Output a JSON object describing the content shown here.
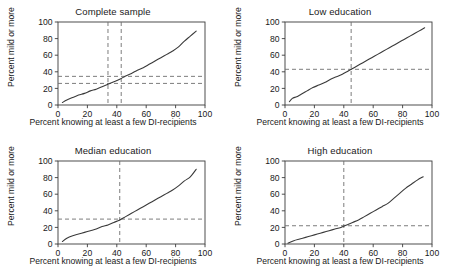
{
  "figure": {
    "width": 453,
    "height": 278,
    "background": "#ffffff",
    "line_color": "#3a3a3a",
    "refline_color": "#6e6e6e",
    "axis_color": "#3b3b3b"
  },
  "common": {
    "xlabel": "Percent knowing at least a few DI-recipients",
    "ylabel": "Percent mild or more",
    "xticks": [
      0,
      20,
      40,
      60,
      80,
      100
    ],
    "yticks": [
      0,
      20,
      40,
      60,
      80,
      100
    ],
    "xlim": [
      0,
      100
    ],
    "ylim": [
      0,
      100
    ]
  },
  "chart_data": [
    {
      "type": "line",
      "panel": 1,
      "title": "Complete sample",
      "xlabel": "Percent knowing at least a few DI-recipients",
      "ylabel": "Percent mild or more",
      "xlim": [
        0,
        100
      ],
      "ylim": [
        0,
        100
      ],
      "xticks": [
        0,
        20,
        40,
        60,
        80,
        100
      ],
      "yticks": [
        0,
        20,
        40,
        60,
        80,
        100
      ],
      "grid": false,
      "legend": "none",
      "x": [
        3,
        6,
        10,
        14,
        18,
        22,
        26,
        30,
        34,
        38,
        42,
        46,
        50,
        54,
        58,
        62,
        66,
        70,
        74,
        78,
        82,
        86,
        90,
        94
      ],
      "y": [
        3,
        6,
        9,
        12,
        14,
        17,
        19,
        22,
        25,
        28,
        31,
        35,
        38,
        42,
        45,
        49,
        53,
        57,
        61,
        65,
        70,
        77,
        83,
        89
      ],
      "reference_lines": {
        "vertical": [
          34,
          43
        ],
        "horizontal": [
          26,
          34.5
        ]
      },
      "annotations": []
    },
    {
      "type": "line",
      "panel": 2,
      "title": "Low education",
      "xlabel": "Percent knowing at least a few DI-recipients",
      "ylabel": "Percent mild or more",
      "xlim": [
        0,
        100
      ],
      "ylim": [
        0,
        100
      ],
      "xticks": [
        0,
        20,
        40,
        60,
        80,
        100
      ],
      "yticks": [
        0,
        20,
        40,
        60,
        80,
        100
      ],
      "grid": false,
      "legend": "none",
      "x": [
        3,
        5,
        8,
        11,
        15,
        19,
        23,
        27,
        31,
        35,
        39,
        43,
        47,
        51,
        55,
        59,
        63,
        67,
        71,
        75,
        79,
        83,
        87,
        91,
        95
      ],
      "y": [
        4,
        8,
        10,
        13,
        17,
        21,
        24,
        27,
        31,
        34,
        37,
        41,
        45,
        49,
        53,
        57,
        61,
        65,
        69,
        73,
        77,
        81,
        85,
        89,
        93
      ],
      "reference_lines": {
        "vertical": [
          45
        ],
        "horizontal": [
          43
        ]
      },
      "annotations": []
    },
    {
      "type": "line",
      "panel": 3,
      "title": "Median education",
      "xlabel": "Percent knowing at least a few DI-recipients",
      "ylabel": "Percent mild or more",
      "xlim": [
        0,
        100
      ],
      "ylim": [
        0,
        100
      ],
      "xticks": [
        0,
        20,
        40,
        60,
        80,
        100
      ],
      "yticks": [
        0,
        20,
        40,
        60,
        80,
        100
      ],
      "grid": false,
      "legend": "none",
      "x": [
        3,
        6,
        10,
        14,
        18,
        22,
        26,
        30,
        34,
        38,
        42,
        46,
        50,
        54,
        58,
        62,
        66,
        70,
        74,
        78,
        82,
        86,
        90,
        94
      ],
      "y": [
        3,
        7,
        10,
        12,
        14,
        16,
        18,
        21,
        23,
        26,
        29,
        33,
        37,
        41,
        45,
        49,
        53,
        57,
        61,
        65,
        70,
        76,
        81,
        90
      ],
      "reference_lines": {
        "vertical": [
          42
        ],
        "horizontal": [
          30
        ]
      },
      "annotations": []
    },
    {
      "type": "line",
      "panel": 4,
      "title": "High education",
      "xlabel": "Percent knowing at least a few DI-recipients",
      "ylabel": "Percent mild or more",
      "xlim": [
        0,
        100
      ],
      "ylim": [
        0,
        100
      ],
      "xticks": [
        0,
        20,
        40,
        60,
        80,
        100
      ],
      "yticks": [
        0,
        20,
        40,
        60,
        80,
        100
      ],
      "grid": false,
      "legend": "none",
      "x": [
        2,
        6,
        10,
        14,
        18,
        22,
        26,
        30,
        34,
        38,
        42,
        46,
        50,
        54,
        58,
        62,
        66,
        70,
        74,
        78,
        82,
        86,
        90,
        94
      ],
      "y": [
        1,
        4,
        6,
        8,
        10,
        12,
        14,
        16,
        18,
        20,
        23,
        26,
        29,
        33,
        37,
        41,
        45,
        49,
        55,
        61,
        67,
        72,
        77,
        81
      ],
      "reference_lines": {
        "vertical": [
          40
        ],
        "horizontal": [
          22
        ]
      },
      "annotations": []
    }
  ]
}
